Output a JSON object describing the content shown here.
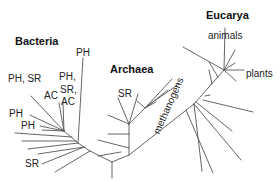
{
  "diagram": {
    "type": "phylogenetic-tree",
    "domains": {
      "bacteria": "Bacteria",
      "archaea": "Archaea",
      "eucarya": "Eucarya"
    },
    "labels": {
      "b_ph_top": "PH",
      "b_phsr": "PH, SR",
      "b_ph2": "PH,",
      "b_sr2": "SR,",
      "b_ac2": "AC",
      "b_ac1": "AC",
      "b_ph3": "PH",
      "b_ph4": "PH",
      "b_sr_bottom": "SR",
      "a_sr": "SR",
      "a_methanogens": "methanogens",
      "e_animals": "animals",
      "e_plants": "plants"
    },
    "line_color": "#555555"
  }
}
